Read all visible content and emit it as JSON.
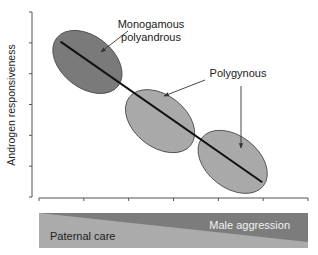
{
  "chart_data": {
    "type": "scatter",
    "title": "",
    "ylabel": "Androgen responsiveness",
    "xlabel": "",
    "x_ticks": 7,
    "y_ticks": 7,
    "trend_line": {
      "from": [
        0.08,
        0.84
      ],
      "to": [
        0.83,
        0.08
      ]
    },
    "groups": [
      {
        "name": "Monogamous polyandrous",
        "label_lines": [
          "Monogamous",
          "polyandrous"
        ],
        "center": [
          0.18,
          0.73
        ],
        "fill": "#7a7a7a"
      },
      {
        "name": "Polygynous (lower left cluster)",
        "label_lines": [
          "Polygynous"
        ],
        "center": [
          0.45,
          0.41
        ],
        "fill": "#a9a9a9"
      },
      {
        "name": "Polygynous (lower right cluster)",
        "label_lines": [],
        "center": [
          0.72,
          0.19
        ],
        "fill": "#a9a9a9"
      }
    ],
    "gradient_bar": {
      "left_label": "Paternal care",
      "right_label": "Male aggression",
      "light_color": "#a9a9a9",
      "dark_color": "#7c7c7c"
    }
  }
}
